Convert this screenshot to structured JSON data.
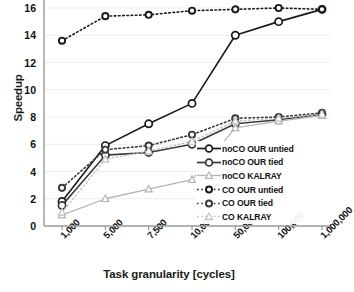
{
  "chart_data": {
    "type": "line",
    "title": "",
    "xlabel": "Task granularity [cycles]",
    "ylabel": "Speedup",
    "categories": [
      "1,000",
      "5,000",
      "7,500",
      "10,000",
      "50,000",
      "100,000",
      "1,000,000"
    ],
    "ylim": [
      0,
      16
    ],
    "yticks": [
      0,
      2,
      4,
      6,
      8,
      10,
      12,
      14,
      16
    ],
    "grid": "horizontal",
    "legend_position": "bottom-right",
    "series": [
      {
        "name": "noCO OUR untied",
        "values": [
          1.8,
          5.9,
          7.5,
          9.0,
          14.0,
          15.0,
          15.9
        ],
        "color": "#1a1a1a",
        "marker": "circle",
        "dash": "solid"
      },
      {
        "name": "noCO OUR tied",
        "values": [
          1.5,
          5.2,
          5.4,
          6.0,
          7.5,
          7.8,
          8.2
        ],
        "color": "#3a3a3a",
        "marker": "circle",
        "dash": "solid"
      },
      {
        "name": "noCO KALRAY",
        "values": [
          0.8,
          2.0,
          2.7,
          3.4,
          7.2,
          7.7,
          8.1
        ],
        "color": "#b4b4b4",
        "marker": "triangle",
        "dash": "solid"
      },
      {
        "name": "CO OUR untied",
        "values": [
          13.6,
          15.4,
          15.5,
          15.8,
          15.9,
          16.0,
          15.9
        ],
        "color": "#1a1a1a",
        "marker": "circle",
        "dash": "dotted"
      },
      {
        "name": "CO OUR tied",
        "values": [
          2.8,
          5.6,
          5.9,
          6.7,
          7.9,
          8.0,
          8.3
        ],
        "color": "#3a3a3a",
        "marker": "circle",
        "dash": "dotted"
      },
      {
        "name": "CO KALRAY",
        "values": [
          1.0,
          4.9,
          5.5,
          6.2,
          7.7,
          7.9,
          8.2
        ],
        "color": "#c0c0c0",
        "marker": "triangle",
        "dash": "dotted"
      }
    ]
  },
  "axes": {
    "y_label": "Speedup",
    "x_label": "Task granularity [cycles]",
    "y_ticks": [
      "16",
      "14",
      "12",
      "10",
      "8",
      "6",
      "4",
      "2",
      "0"
    ],
    "x_ticks": [
      "1,000",
      "5,000",
      "7,500",
      "10,000",
      "50,000",
      "100,000",
      "1,000,000"
    ]
  },
  "legend": {
    "items": [
      {
        "label": "noCO OUR untied"
      },
      {
        "label": "noCO OUR tied"
      },
      {
        "label": "noCO KALRAY"
      },
      {
        "label": "CO OUR untied"
      },
      {
        "label": "CO OUR tied"
      },
      {
        "label": "CO KALRAY"
      }
    ]
  }
}
